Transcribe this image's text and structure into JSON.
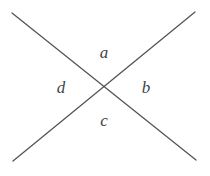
{
  "diagram": {
    "type": "intersecting-lines",
    "line_color": "#555555",
    "label_color": "#444444",
    "lines": [
      {
        "x1": 12,
        "y1": 13,
        "x2": 196,
        "y2": 160
      },
      {
        "x1": 195,
        "y1": 12,
        "x2": 13,
        "y2": 161
      }
    ],
    "intersection": {
      "x": 104,
      "y": 87
    },
    "angles": [
      {
        "label": "a",
        "x": 104,
        "y": 58
      },
      {
        "label": "b",
        "x": 146,
        "y": 93
      },
      {
        "label": "c",
        "x": 104,
        "y": 126
      },
      {
        "label": "d",
        "x": 61,
        "y": 93
      }
    ]
  }
}
